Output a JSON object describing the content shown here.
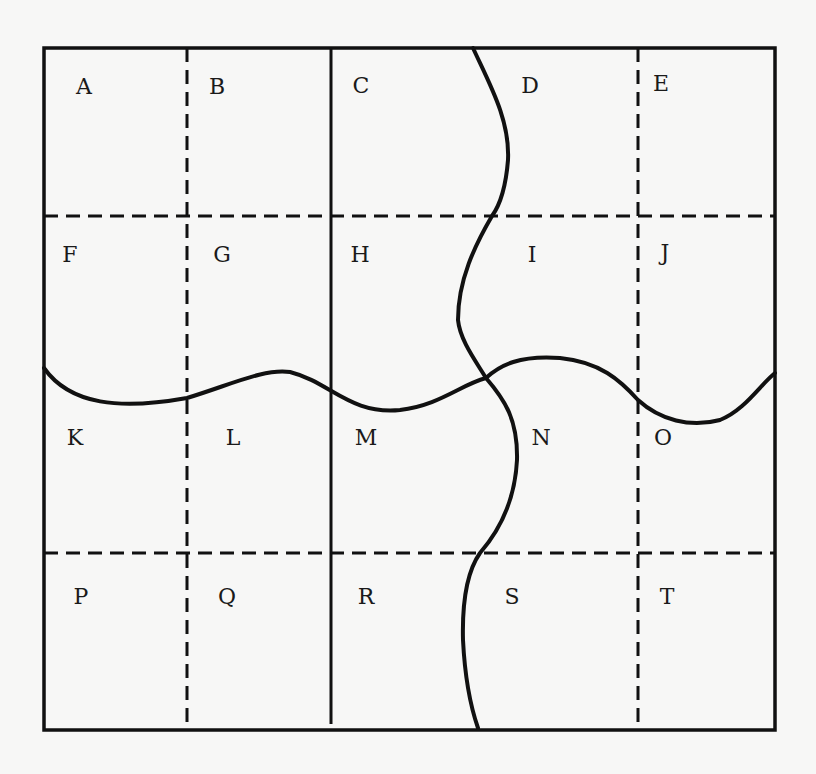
{
  "diagram": {
    "type": "grid-regions",
    "colors": {
      "background": "#f7f7f6",
      "line": "#111111",
      "label": "#1a1a1a"
    },
    "frame": {
      "x": 44,
      "y": 48,
      "width": 731,
      "height": 682
    },
    "lines": {
      "solid_vertical": {
        "x": 331,
        "y1": 48,
        "y2": 724
      },
      "dashed_verticals": [
        {
          "x": 187,
          "y1": 48,
          "y2": 730
        },
        {
          "x": 638,
          "y1": 48,
          "y2": 724
        }
      ],
      "dashed_horizontals": [
        {
          "y": 216,
          "x1": 44,
          "x2": 775
        },
        {
          "y": 553,
          "x1": 44,
          "x2": 775
        }
      ],
      "wavy_horizontal": "M44,368 C70,405 120,410 187,398 C230,385 265,368 290,372 C330,382 350,415 400,410 C440,405 460,385 486,378 C500,365 520,355 560,358 C600,362 620,380 638,400 C660,420 690,428 720,420 C745,410 760,385 775,373",
      "wavy_vertical": "M473,48 C490,85 510,120 508,160 C506,185 500,205 492,216 C475,245 458,280 458,320 C460,340 475,360 486,378 C505,400 518,420 517,460 C515,500 500,530 480,553 C468,570 462,600 463,640 C465,680 470,705 478,728"
    },
    "regions": [
      {
        "label": "A",
        "x": 84,
        "y": 94
      },
      {
        "label": "B",
        "x": 217,
        "y": 94
      },
      {
        "label": "C",
        "x": 361,
        "y": 93
      },
      {
        "label": "D",
        "x": 530,
        "y": 93
      },
      {
        "label": "E",
        "x": 661,
        "y": 91
      },
      {
        "label": "F",
        "x": 70,
        "y": 262
      },
      {
        "label": "G",
        "x": 222,
        "y": 262
      },
      {
        "label": "H",
        "x": 360,
        "y": 262
      },
      {
        "label": "I",
        "x": 532,
        "y": 262
      },
      {
        "label": "J",
        "x": 665,
        "y": 260
      },
      {
        "label": "K",
        "x": 75,
        "y": 445
      },
      {
        "label": "L",
        "x": 233,
        "y": 445
      },
      {
        "label": "M",
        "x": 366,
        "y": 445
      },
      {
        "label": "N",
        "x": 541,
        "y": 445
      },
      {
        "label": "O",
        "x": 663,
        "y": 445
      },
      {
        "label": "P",
        "x": 81,
        "y": 604
      },
      {
        "label": "Q",
        "x": 227,
        "y": 604
      },
      {
        "label": "R",
        "x": 366,
        "y": 604
      },
      {
        "label": "S",
        "x": 512,
        "y": 604
      },
      {
        "label": "T",
        "x": 667,
        "y": 604
      }
    ]
  }
}
